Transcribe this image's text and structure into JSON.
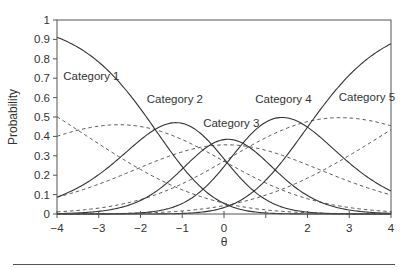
{
  "colors": {
    "axis": "#555555",
    "solid_curve": "#333333",
    "dashed_curve": "#555555",
    "text": "#333333",
    "background": "#ffffff"
  },
  "chart_data": {
    "type": "line",
    "title": "",
    "xlabel": "θ",
    "ylabel": "Probability",
    "xlim": [
      -4,
      4
    ],
    "ylim": [
      0,
      1
    ],
    "grid": false,
    "legend": "inline labels",
    "x_ticks": [
      -4,
      -3,
      -2,
      -1,
      0,
      1,
      2,
      3,
      4
    ],
    "x_tick_labels": [
      "−4",
      "−3",
      "−2",
      "−1",
      "0",
      "",
      "2",
      "3",
      "4"
    ],
    "y_ticks": [
      0,
      0.1,
      0.2,
      0.3,
      0.4,
      0.5,
      0.6,
      0.7,
      0.8,
      0.9,
      1
    ],
    "y_tick_labels": [
      "0",
      "0.1",
      "0.2",
      "0.3",
      "0.4",
      "0.5",
      "0.6",
      "0.7",
      "0.8",
      "0.9",
      "1"
    ],
    "annotations": [
      {
        "text": "Category 1",
        "x": -3.85,
        "y": 0.69
      },
      {
        "text": "Category 2",
        "x": -1.85,
        "y": 0.57
      },
      {
        "text": "Category 3",
        "x": -0.5,
        "y": 0.45
      },
      {
        "text": "Category 4",
        "x": 0.75,
        "y": 0.57
      },
      {
        "text": "Category 5",
        "x": 2.75,
        "y": 0.58
      }
    ],
    "model": {
      "solid": {
        "a": 1.0,
        "b": [
          -1.65,
          -0.3,
          0.45,
          2.0
        ]
      },
      "dashed": {
        "a": 0.45,
        "b": [
          -3.5,
          -0.6,
          0.6,
          4.1
        ]
      }
    },
    "x": [
      -4,
      -3,
      -2,
      -1,
      0,
      1,
      2,
      3,
      4
    ],
    "series": [
      {
        "name": "Category 1",
        "style": "solid",
        "values": [
          0.91,
          0.78,
          0.54,
          0.24,
          0.05,
          0.01,
          0.0,
          0.0,
          0.0
        ]
      },
      {
        "name": "Category 2",
        "style": "solid",
        "values": [
          0.09,
          0.2,
          0.38,
          0.47,
          0.28,
          0.07,
          0.01,
          0.0,
          0.0
        ]
      },
      {
        "name": "Category 3",
        "style": "solid",
        "values": [
          0.0,
          0.01,
          0.07,
          0.23,
          0.38,
          0.27,
          0.1,
          0.02,
          0.0
        ]
      },
      {
        "name": "Category 4",
        "style": "solid",
        "values": [
          0.0,
          0.0,
          0.01,
          0.05,
          0.25,
          0.47,
          0.45,
          0.26,
          0.12
        ]
      },
      {
        "name": "Category 5",
        "style": "solid",
        "values": [
          0.0,
          0.0,
          0.0,
          0.0,
          0.03,
          0.17,
          0.45,
          0.72,
          0.88
        ]
      },
      {
        "name": "Category 1 (dashed)",
        "style": "dashed",
        "values": [
          0.5,
          0.4,
          0.23,
          0.12,
          0.06,
          0.02,
          0.01,
          0.0,
          0.0
        ]
      },
      {
        "name": "Category 2 (dashed)",
        "style": "dashed",
        "values": [
          0.4,
          0.44,
          0.45,
          0.38,
          0.27,
          0.16,
          0.08,
          0.04,
          0.01
        ]
      },
      {
        "name": "Category 3 (dashed)",
        "style": "dashed",
        "values": [
          0.09,
          0.14,
          0.24,
          0.32,
          0.36,
          0.32,
          0.25,
          0.17,
          0.1
        ]
      },
      {
        "name": "Category 4 (dashed)",
        "style": "dashed",
        "values": [
          0.01,
          0.02,
          0.08,
          0.16,
          0.27,
          0.38,
          0.48,
          0.49,
          0.45
        ]
      },
      {
        "name": "Category 5 (dashed)",
        "style": "dashed",
        "values": [
          0.0,
          0.0,
          0.01,
          0.02,
          0.04,
          0.1,
          0.19,
          0.3,
          0.43
        ]
      }
    ]
  },
  "plot_area": {
    "left": 57,
    "right": 391,
    "top": 20,
    "bottom": 214
  }
}
